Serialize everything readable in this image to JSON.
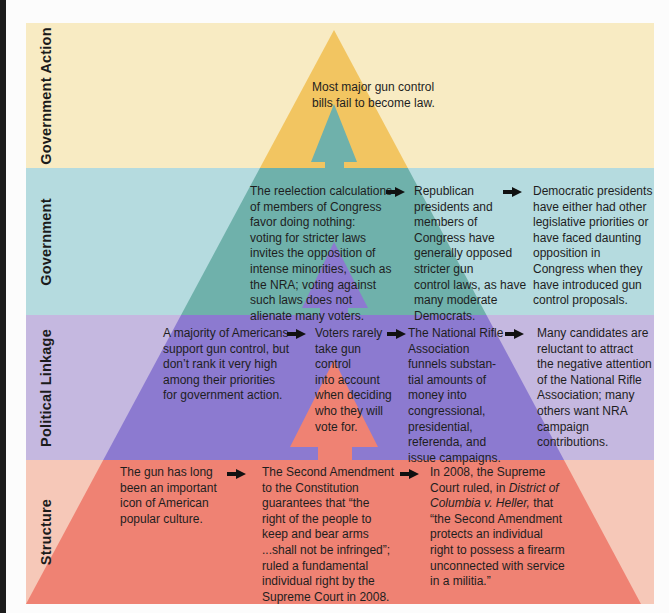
{
  "colors": {
    "gov_action_bg": "#f8ebc3",
    "gov_action_tri": "#f2c561",
    "government_bg": "#b5dbdf",
    "government_tri": "#6fb1ab",
    "political_bg": "#c5b8e0",
    "political_tri": "#8c7ad0",
    "structure_bg": "#f6c8b8",
    "structure_tri": "#ef8273"
  },
  "rows": {
    "government_action": {
      "label": "Government Action",
      "items": [
        "Most major gun control\nbills fail to become law."
      ]
    },
    "government": {
      "label": "Government",
      "items": [
        "The reelection calculations\nof members of Congress\nfavor doing nothing:\nvoting for stricter laws\ninvites the opposition of\nintense minorities, such as\nthe NRA; voting against\nsuch laws does not\nalienate many voters.",
        "Republican\npresidents and\nmembers of\nCongress have\ngenerally opposed\nstricter gun\ncontrol laws, as have\nmany moderate\nDemocrats.",
        "Democratic presidents\nhave either had other\nlegislative priorities or\nhave faced daunting\nopposition in\nCongress when they\nhave introduced gun\ncontrol proposals."
      ]
    },
    "political_linkage": {
      "label": "Political Linkage",
      "items": [
        "A majority of Americans\nsupport gun control, but\ndon’t rank it very high\namong their priorities\nfor government action.",
        "Voters rarely\ntake gun\ncontrol\ninto account\nwhen deciding\nwho they will\nvote for.",
        "The National Rifle\nAssociation\nfunnels substan-\ntial amounts of\nmoney into\ncongressional,\npresidential,\nreferenda, and\nissue campaigns.",
        "Many candidates are\nreluctant to attract\nthe negative attention\nof the National Rifle\nAssociation; many\nothers want NRA\ncampaign\ncontributions."
      ]
    },
    "structure": {
      "label": "Structure",
      "items": [
        "The gun has long\nbeen an important\nicon of American\npopular culture.",
        "The Second Amendment\nto the Constitution\nguarantees that “the\nright of the people to\nkeep and bear arms\n...shall not be infringed”;\nruled a fundamental\nindividual right by the\nSupreme Court in 2008.",
        {
          "line1": "In 2008, the Supreme",
          "line2a": "Court ruled, in ",
          "line2b": "District of",
          "line3a": "Columbia v. Heller,",
          "line3b": " that",
          "rest": "“the Second Amendment\nprotects an individual\nright to possess a firearm\nunconnected with service\nin a militia.”"
        }
      ]
    }
  }
}
